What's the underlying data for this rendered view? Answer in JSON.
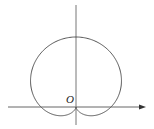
{
  "diagram": {
    "type": "polar-curve",
    "curve": "cardioid",
    "origin_label": "O",
    "colors": {
      "stroke": "#555555",
      "background": "#ffffff"
    }
  }
}
